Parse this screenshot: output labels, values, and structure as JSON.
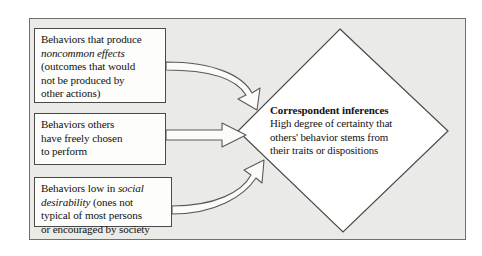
{
  "diagram": {
    "frame": {
      "fill_color": "#eaeae7",
      "border_color": "#6f6f6f"
    },
    "boxes": [
      {
        "name": "noncommon-effects-box",
        "lines": [
          {
            "text": "Behaviors that produce",
            "style": "normal"
          },
          {
            "text": "noncommon effects",
            "style": "italic"
          },
          {
            "text": "(outcomes that would",
            "style": "normal"
          },
          {
            "text": "not be produced by",
            "style": "normal"
          },
          {
            "text": "other actions)",
            "style": "normal"
          }
        ]
      },
      {
        "name": "freely-chosen-box",
        "lines": [
          {
            "text": "Behaviors others",
            "style": "normal"
          },
          {
            "text": "have freely chosen",
            "style": "normal"
          },
          {
            "text": "to perform",
            "style": "normal"
          }
        ]
      },
      {
        "name": "social-desirability-box",
        "lines": [
          {
            "text": "Behaviors low in ",
            "style": "normal"
          },
          {
            "text": "social",
            "style": "italic"
          },
          {
            "text": "desirability",
            "style": "italic"
          },
          {
            "text": " (ones not",
            "style": "normal"
          },
          {
            "text": "typical of most persons",
            "style": "normal"
          },
          {
            "text": "or encouraged by society",
            "style": "normal"
          }
        ]
      }
    ],
    "box_text": {
      "box1_line1": "Behaviors that produce",
      "box1_line2": "noncommon effects",
      "box1_line3": "(outcomes that would",
      "box1_line4": "not be produced by",
      "box1_line5": "other actions)",
      "box2_line1": "Behaviors others",
      "box2_line2": "have freely chosen",
      "box2_line3": "to perform",
      "box3_line1a": "Behaviors low in ",
      "box3_line1b": "social",
      "box3_line2a": "desirability",
      "box3_line2b": " (ones not",
      "box3_line3": "typical of most persons",
      "box3_line4": "or encouraged by society"
    },
    "diamond": {
      "name": "correspondent-inferences-diamond",
      "heading": "Correspondent inferences",
      "body_line1": "High degree of certainty that",
      "body_line2": "others' behavior stems from",
      "body_line3": "their traits or dispositions",
      "fill_color": "#ffffff",
      "border_color": "#4a4a4a"
    },
    "arrows": [
      {
        "name": "arrow-from-noncommon-effects",
        "shape": "curved",
        "direction": "right-down"
      },
      {
        "name": "arrow-from-freely-chosen",
        "shape": "straight",
        "direction": "right"
      },
      {
        "name": "arrow-from-social-desirability",
        "shape": "curved",
        "direction": "right-up"
      }
    ]
  }
}
